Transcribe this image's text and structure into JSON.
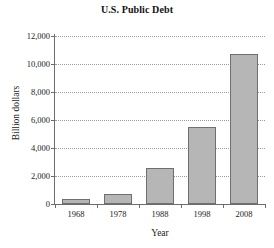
{
  "chart_data": {
    "type": "bar",
    "title": "U.S. Public Debt",
    "xlabel": "Year",
    "ylabel": "Billion dollars",
    "categories": [
      "1968",
      "1978",
      "1988",
      "1998",
      "2008"
    ],
    "values": [
      350,
      700,
      2570,
      5500,
      10700
    ],
    "ylim": [
      0,
      12000
    ],
    "yticks": [
      0,
      2000,
      4000,
      6000,
      8000,
      10000,
      12000
    ],
    "ytick_labels": [
      "0",
      "2,000",
      "4,000",
      "6,000",
      "8,000",
      "10,000",
      "12,000"
    ],
    "grid": true,
    "grid_axis": "y",
    "grid_style": "dotted",
    "legend": null,
    "bar_color": "#b6b6b6",
    "bar_border_color": "#6f6f6f",
    "axis_color": "#6d6d6d",
    "grid_color": "#9a9a9a",
    "background": "#ffffff"
  }
}
